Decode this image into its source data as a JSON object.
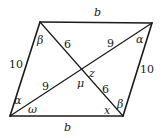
{
  "figure": {
    "type": "parallelogram",
    "vertices": {
      "top_left": [
        40,
        22
      ],
      "top_right": [
        152,
        23
      ],
      "bottom_right": [
        123,
        116
      ],
      "bottom_left": [
        10,
        116
      ],
      "diagonal_intersection": [
        82,
        70
      ]
    },
    "side_labels": {
      "top": "b",
      "bottom": "b",
      "left": "10",
      "right": "10"
    },
    "diagonal_segment_labels": {
      "tl_to_center": "6",
      "center_to_br": "6",
      "bl_to_center": "9",
      "center_to_tr": "9"
    },
    "angle_labels": {
      "top_left": "β",
      "top_right": "α",
      "bottom_left_upper": "α",
      "bottom_left_lower": "ω",
      "bottom_right_upper": "β",
      "bottom_right_lower": "x",
      "center_right": "z",
      "center_bottom": "μ"
    }
  }
}
